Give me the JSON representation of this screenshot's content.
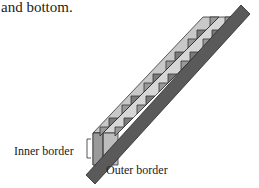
{
  "text": {
    "intro": "and bottom.",
    "inner_label": "Inner border",
    "outer_label": "Outer border"
  },
  "colors": {
    "outer_border": "#5a5a5a",
    "outer_border_stroke": "#2a2a2a",
    "stripe_light": "#d2d2d2",
    "stripe_mid": "#a8a8a8",
    "stripe_dark": "#888888",
    "line": "#333333"
  }
}
